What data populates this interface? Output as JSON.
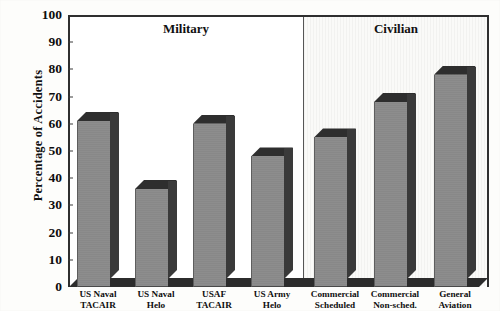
{
  "chart_data": {
    "type": "bar",
    "title": "",
    "xlabel": "",
    "ylabel": "Percentage of Accidents",
    "ylim": [
      0,
      100
    ],
    "ytick_step": 10,
    "yticks": [
      0,
      10,
      20,
      30,
      40,
      50,
      60,
      70,
      80,
      90,
      100
    ],
    "grid": false,
    "legend": "none",
    "style": "3d-shaded-bars",
    "categories": [
      "US Naval TACAIR",
      "US Naval Helo",
      "USAF TACAIR",
      "US Army Helo",
      "Commercial Scheduled",
      "Commercial Non-sched.",
      "General Aviation"
    ],
    "values": [
      61,
      36,
      60,
      48,
      55,
      68,
      78
    ],
    "series": [
      {
        "name": "Percentage of Accidents",
        "values": [
          61,
          36,
          60,
          48,
          55,
          68,
          78
        ]
      }
    ],
    "annotations": [
      {
        "text": "Military",
        "covers": [
          "US Naval TACAIR",
          "US Naval Helo",
          "USAF TACAIR",
          "US Army Helo"
        ]
      },
      {
        "text": "Civilian",
        "covers": [
          "Commercial Scheduled",
          "Commercial Non-sched.",
          "General Aviation"
        ]
      }
    ],
    "colors": {
      "bar_front": "#8d8d8d",
      "bar_side": "#3a3a3a",
      "bar_top": "#2e2e2e",
      "axis": "#2f2f2f",
      "panel_military_bg": "#ffffff",
      "panel_civilian_bg": "#f4f4f2"
    }
  },
  "axis": {
    "y_title": "Percentage of Accidents",
    "y_ticks": [
      {
        "label": "100",
        "value": 100
      },
      {
        "label": "90",
        "value": 90
      },
      {
        "label": "80",
        "value": 80
      },
      {
        "label": "70",
        "value": 70
      },
      {
        "label": "60",
        "value": 60
      },
      {
        "label": "50",
        "value": 50
      },
      {
        "label": "40",
        "value": 40
      },
      {
        "label": "30",
        "value": 30
      },
      {
        "label": "20",
        "value": 20
      },
      {
        "label": "10",
        "value": 10
      },
      {
        "label": "0",
        "value": 0
      }
    ]
  },
  "sections": [
    {
      "label": "Military"
    },
    {
      "label": "Civilian"
    }
  ],
  "bars": [
    {
      "line1": "US Naval",
      "line2": "TACAIR",
      "value": 61
    },
    {
      "line1": "US Naval",
      "line2": "Helo",
      "value": 36
    },
    {
      "line1": "USAF",
      "line2": "TACAIR",
      "value": 60
    },
    {
      "line1": "US Army",
      "line2": "Helo",
      "value": 48
    },
    {
      "line1": "Commercial",
      "line2": "Scheduled",
      "value": 55
    },
    {
      "line1": "Commercial",
      "line2": "Non-sched.",
      "value": 68
    },
    {
      "line1": "General",
      "line2": "Aviation",
      "value": 78
    }
  ]
}
